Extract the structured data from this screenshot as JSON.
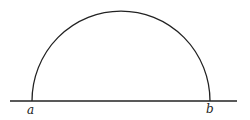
{
  "diagram": {
    "type": "semicircle-on-line",
    "labels": {
      "left": "a",
      "right": "b"
    },
    "stroke_color": "#222222",
    "background": "#ffffff"
  }
}
